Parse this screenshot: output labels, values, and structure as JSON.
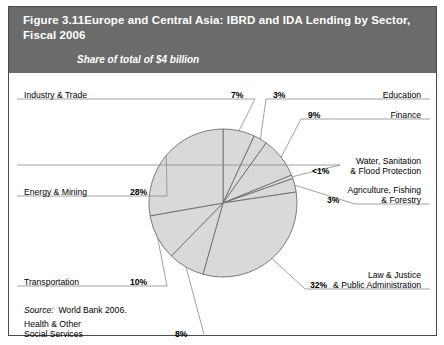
{
  "figure": {
    "number": "Figure 3.11",
    "title": "Europe and Central Asia: IBRD and IDA Lending by Sector, Fiscal 2006",
    "subtitle": "Share of total of $4 billion",
    "source_prefix": "Source:",
    "source_text": "World Bank 2006."
  },
  "colors": {
    "header_bg": "#6b6b6b",
    "header_text": "#ffffff",
    "pie_fill": "#d9d9d9",
    "pie_stroke": "#6e6e6e",
    "leader_line": "#8a8a8a",
    "border": "#4a4a4a"
  },
  "chart_data": {
    "type": "pie",
    "title": "Europe and Central Asia: IBRD and IDA Lending by Sector, Fiscal 2006",
    "subtitle": "Share of total of $4 billion",
    "unit": "percent of total",
    "total": "$4 billion",
    "labels": [
      "Industry & Trade",
      "Education",
      "Finance",
      "Water, Sanitation & Flood Protection",
      "Agriculture, Fishing & Forestry",
      "Law & Justice & Public Administration",
      "Health & Other Social Services",
      "Transportation",
      "Energy & Mining"
    ],
    "values": [
      7,
      3,
      9,
      0.8,
      3,
      32,
      8,
      10,
      28
    ],
    "value_labels": [
      "7%",
      "3%",
      "9%",
      "<1%",
      "3%",
      "32%",
      "8%",
      "10%",
      "28%"
    ],
    "legend": "none",
    "start_angle_deg": 0,
    "direction": "clockwise"
  },
  "slices": [
    {
      "name": "industry-trade",
      "label_l1": "Industry & Trade",
      "label_l2": "",
      "pct": "7%"
    },
    {
      "name": "education",
      "label_l1": "Education",
      "label_l2": "",
      "pct": "3%"
    },
    {
      "name": "finance",
      "label_l1": "Finance",
      "label_l2": "",
      "pct": "9%"
    },
    {
      "name": "water-sanitation",
      "label_l1": "Water, Sanitation",
      "label_l2": "& Flood Protection",
      "pct": "<1%"
    },
    {
      "name": "agriculture",
      "label_l1": "Agriculture, Fishing",
      "label_l2": "& Forestry",
      "pct": "3%"
    },
    {
      "name": "law-justice",
      "label_l1": "Law & Justice",
      "label_l2": "& Public Administration",
      "pct": "32%"
    },
    {
      "name": "health-social",
      "label_l1": "Health & Other",
      "label_l2": "Social Services",
      "pct": "8%"
    },
    {
      "name": "transportation",
      "label_l1": "Transportation",
      "label_l2": "",
      "pct": "10%"
    },
    {
      "name": "energy-mining",
      "label_l1": "Energy & Mining",
      "label_l2": "",
      "pct": "28%"
    }
  ]
}
